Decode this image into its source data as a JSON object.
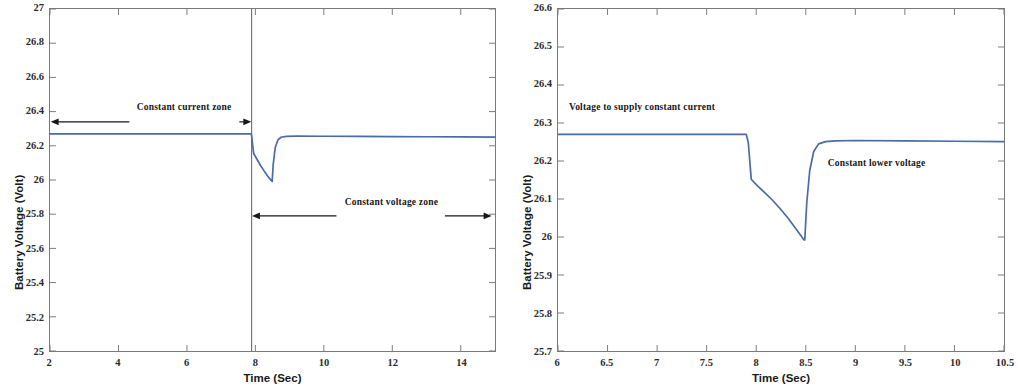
{
  "figure": {
    "background": "#ffffff",
    "line_color": "#4a6aa8",
    "axis_color": "#7a7a7a",
    "annotation_color": "#171717"
  },
  "chart_data": [
    {
      "panel": "left",
      "type": "line",
      "title": "",
      "xlabel": "Time (Sec)",
      "ylabel": "Battery Voltage (Volt)",
      "xlim": [
        2,
        15
      ],
      "ylim": [
        25,
        27
      ],
      "xticks": [
        2,
        4,
        6,
        8,
        10,
        12,
        14
      ],
      "xtick_labels": [
        "2",
        "4",
        "6",
        "8",
        "10",
        "12",
        "14"
      ],
      "yticks": [
        25,
        25.2,
        25.4,
        25.6,
        25.8,
        26,
        26.2,
        26.4,
        26.6,
        26.8,
        27
      ],
      "ytick_labels": [
        "25",
        "25.2",
        "25.4",
        "25.6",
        "25.8",
        "26",
        "26.2",
        "26.4",
        "26.6",
        "26.8",
        "27"
      ],
      "grid": false,
      "legend": null,
      "series": [
        {
          "name": "Battery Voltage",
          "color": "#4a6aa8",
          "x": [
            2.0,
            3.0,
            4.0,
            5.0,
            6.0,
            7.0,
            7.6,
            7.88,
            7.9,
            7.95,
            8.05,
            8.15,
            8.25,
            8.35,
            8.42,
            8.47,
            8.49,
            8.52,
            8.58,
            8.66,
            8.75,
            8.9,
            9.2,
            10.0,
            11.0,
            12.0,
            13.0,
            14.0,
            15.0
          ],
          "y": [
            26.27,
            26.27,
            26.27,
            26.27,
            26.27,
            26.27,
            26.27,
            26.27,
            26.24,
            26.155,
            26.12,
            26.085,
            26.055,
            26.025,
            26.008,
            25.995,
            25.992,
            26.09,
            26.19,
            26.235,
            26.25,
            26.255,
            26.257,
            26.256,
            26.255,
            26.254,
            26.253,
            26.252,
            26.251
          ]
        }
      ],
      "annotations": [
        {
          "id": "constant-current-zone",
          "text": "Constant current zone",
          "text_x": 4.55,
          "text_y": 26.41,
          "arrow": {
            "type": "double-headed",
            "x_start": 2.02,
            "x_end": 7.88,
            "y": 26.34
          }
        },
        {
          "id": "constant-voltage-zone",
          "text": "Constant voltage zone",
          "text_x": 10.6,
          "text_y": 25.86,
          "arrow": {
            "type": "double-headed",
            "x_start": 7.9,
            "x_end": 14.9,
            "y": 25.79
          }
        }
      ],
      "vertical_divider": {
        "id": "zone-divider",
        "x": 7.89
      }
    },
    {
      "panel": "right",
      "type": "line",
      "title": "",
      "xlabel": "Time (Sec)",
      "ylabel": "Battery Voltage (Volt)",
      "xlim": [
        6,
        10.5
      ],
      "ylim": [
        25.7,
        26.6
      ],
      "xticks": [
        6,
        6.5,
        7,
        7.5,
        8,
        8.5,
        9,
        9.5,
        10,
        10.5
      ],
      "xtick_labels": [
        "6",
        "6.5",
        "7",
        "7.5",
        "8",
        "8.5",
        "9",
        "9.5",
        "10",
        "10.5"
      ],
      "yticks": [
        25.7,
        25.8,
        25.9,
        26,
        26.1,
        26.2,
        26.3,
        26.4,
        26.5,
        26.6
      ],
      "ytick_labels": [
        "25.7",
        "25.8",
        "25.9",
        "26",
        "26.1",
        "26.2",
        "26.3",
        "26.4",
        "26.5",
        "26.6"
      ],
      "grid": false,
      "legend": null,
      "series": [
        {
          "name": "Battery Voltage",
          "color": "#4a6aa8",
          "x": [
            6.0,
            6.5,
            7.0,
            7.5,
            7.8,
            7.9,
            7.92,
            7.95,
            8.0,
            8.08,
            8.16,
            8.24,
            8.32,
            8.4,
            8.45,
            8.48,
            8.49,
            8.51,
            8.54,
            8.58,
            8.63,
            8.7,
            8.8,
            9.0,
            9.5,
            10.0,
            10.5
          ],
          "y": [
            26.27,
            26.27,
            26.27,
            26.27,
            26.27,
            26.27,
            26.248,
            26.152,
            26.138,
            26.118,
            26.098,
            26.075,
            26.05,
            26.022,
            26.004,
            25.993,
            25.992,
            26.09,
            26.175,
            26.225,
            26.245,
            26.251,
            26.253,
            26.254,
            26.253,
            26.252,
            26.251
          ]
        }
      ],
      "annotations": [
        {
          "id": "voltage-to-supply-constant-current",
          "text": "Voltage to supply constant current",
          "text_x": 6.12,
          "text_y": 26.335
        },
        {
          "id": "constant-lower-voltage",
          "text": "Constant lower voltage",
          "text_x": 8.72,
          "text_y": 26.19
        }
      ]
    }
  ]
}
